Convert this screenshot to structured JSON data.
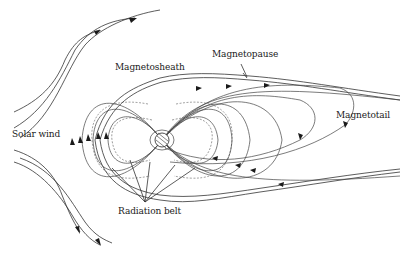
{
  "figure": {
    "labels": {
      "magnetosheath": "Magnetosheath",
      "magnetopause": "Magnetopause",
      "magnetotail": "Magnetotail",
      "solar_wind": "Solar wind",
      "radiation_belt": "Radiation belt"
    },
    "colors": {
      "line": "#333333",
      "background": "#ffffff"
    }
  }
}
